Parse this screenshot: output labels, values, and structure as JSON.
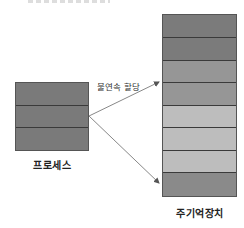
{
  "diagram": {
    "process": {
      "label": "프로세스",
      "rows": [
        {
          "color": "#7a7a7a"
        },
        {
          "color": "#7a7a7a"
        },
        {
          "color": "#7a7a7a"
        }
      ]
    },
    "memory": {
      "label": "주기억장치",
      "rows": [
        {
          "color": "#7b7b7b"
        },
        {
          "color": "#7b7b7b"
        },
        {
          "color": "#969696"
        },
        {
          "color": "#969696"
        },
        {
          "color": "#bdbdbd"
        },
        {
          "color": "#bdbdbd"
        },
        {
          "color": "#bdbdbd"
        },
        {
          "color": "#8a8a8a"
        }
      ]
    },
    "arrow_label": "불연속 할당",
    "arrows": [
      {
        "from": "process",
        "to": "memory-row-4"
      },
      {
        "from": "process",
        "to": "memory-row-8"
      }
    ]
  }
}
